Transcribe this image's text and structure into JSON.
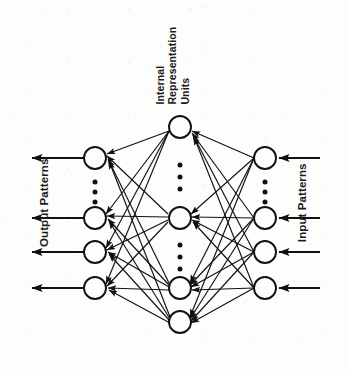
{
  "figure": {
    "type": "neural-network-diagram",
    "title": "",
    "background_color": "#fdfdfc",
    "ink_color": "#111111"
  },
  "labels": {
    "output_patterns": "Output Patterns",
    "input_patterns": "Input Patterns",
    "internal_line1": "Internal",
    "internal_line2": "Representation",
    "internal_line3": "Units"
  },
  "network": {
    "layers": [
      {
        "name": "output-layer",
        "label": "Output Patterns",
        "x": 95,
        "node_radius": 11,
        "nodes_y": [
          158,
          218,
          252,
          288
        ],
        "ellipsis_groups": [
          {
            "x": 95,
            "y": [
              182,
              192,
              202
            ]
          }
        ],
        "arrows": {
          "direction": "left",
          "from_x": 84,
          "to_x": 30,
          "y": [
            158,
            218,
            252,
            288
          ]
        }
      },
      {
        "name": "hidden-layer",
        "label": "Internal Representation Units",
        "x": 180,
        "node_radius": 11,
        "nodes_y": [
          127,
          218,
          288,
          322
        ],
        "ellipsis_groups": [
          {
            "x": 180,
            "y": [
              165,
              177,
              189
            ]
          },
          {
            "x": 180,
            "y": [
              245,
              257,
              269
            ]
          }
        ]
      },
      {
        "name": "input-layer",
        "label": "Input Patterns",
        "x": 265,
        "node_radius": 11,
        "nodes_y": [
          158,
          218,
          252,
          288
        ],
        "ellipsis_groups": [
          {
            "x": 265,
            "y": [
              182,
              192,
              202
            ]
          }
        ],
        "arrows": {
          "direction": "left",
          "from_x": 318,
          "to_x": 277,
          "y": [
            158,
            218,
            252,
            288
          ]
        }
      }
    ],
    "connections": {
      "input_to_hidden": {
        "direction": "right-to-left",
        "fully_connected": true,
        "arrowheads_at": "hidden-layer"
      },
      "hidden_to_output": {
        "direction": "right-to-left",
        "fully_connected": true,
        "arrowheads_at": "output-layer"
      }
    }
  }
}
